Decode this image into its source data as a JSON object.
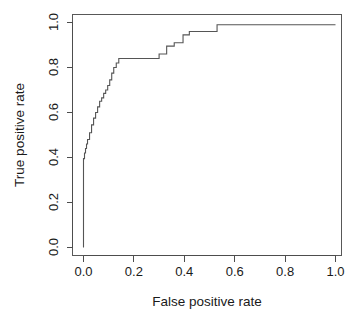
{
  "chart_data": {
    "type": "line",
    "title": "",
    "xlabel": "False positive rate",
    "ylabel": "True positive rate",
    "xlim": [
      0.0,
      1.0
    ],
    "ylim": [
      0.0,
      1.0
    ],
    "grid": false,
    "legend": null,
    "xticks": [
      "0.0",
      "0.2",
      "0.4",
      "0.6",
      "0.8",
      "1.0"
    ],
    "xtick_values": [
      0.0,
      0.2,
      0.4,
      0.6,
      0.8,
      1.0
    ],
    "yticks": [
      "0.0",
      "0.2",
      "0.4",
      "0.6",
      "0.8",
      "1.0"
    ],
    "ytick_values": [
      0.0,
      0.2,
      0.4,
      0.6,
      0.8,
      1.0
    ],
    "series": [
      {
        "name": "ROC curve",
        "style": "step",
        "color": "#555555",
        "x": [
          0.0,
          0.0,
          0.004,
          0.004,
          0.008,
          0.008,
          0.012,
          0.012,
          0.016,
          0.016,
          0.024,
          0.024,
          0.032,
          0.032,
          0.04,
          0.04,
          0.048,
          0.048,
          0.056,
          0.056,
          0.064,
          0.064,
          0.072,
          0.072,
          0.08,
          0.08,
          0.088,
          0.088,
          0.096,
          0.096,
          0.104,
          0.104,
          0.112,
          0.112,
          0.12,
          0.12,
          0.13,
          0.13,
          0.14,
          0.14,
          0.3,
          0.3,
          0.33,
          0.33,
          0.36,
          0.36,
          0.395,
          0.395,
          0.42,
          0.42,
          0.53,
          0.53,
          1.0
        ],
        "y": [
          0.0,
          0.395,
          0.395,
          0.42,
          0.42,
          0.44,
          0.44,
          0.46,
          0.46,
          0.48,
          0.48,
          0.51,
          0.51,
          0.545,
          0.545,
          0.575,
          0.575,
          0.6,
          0.6,
          0.625,
          0.625,
          0.65,
          0.65,
          0.665,
          0.665,
          0.685,
          0.685,
          0.7,
          0.7,
          0.72,
          0.72,
          0.745,
          0.745,
          0.775,
          0.775,
          0.8,
          0.8,
          0.82,
          0.82,
          0.84,
          0.84,
          0.86,
          0.86,
          0.895,
          0.895,
          0.91,
          0.91,
          0.945,
          0.945,
          0.96,
          0.96,
          0.99,
          0.99
        ]
      }
    ]
  },
  "axes": {
    "x_title": "False positive rate",
    "y_title": "True positive rate",
    "x_tick_labels": [
      "0.0",
      "0.2",
      "0.4",
      "0.6",
      "0.8",
      "1.0"
    ],
    "y_tick_labels": [
      "0.0",
      "0.2",
      "0.4",
      "0.6",
      "0.8",
      "1.0"
    ]
  },
  "colors": {
    "curve": "#555555",
    "axis": "#4d4d4d",
    "box": "#585858",
    "background": "#ffffff",
    "text": "#1a1a1a"
  }
}
